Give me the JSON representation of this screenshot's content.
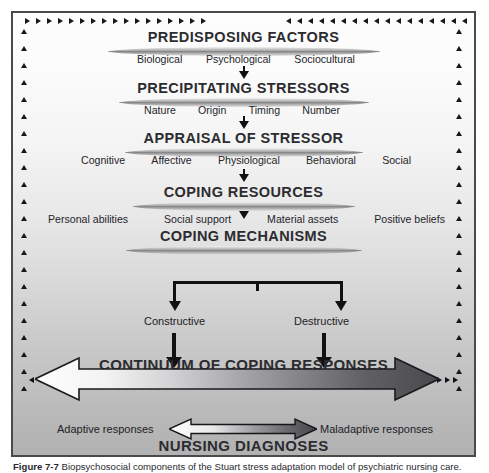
{
  "figure": {
    "headings": {
      "predisposing_factors": "PREDISPOSING FACTORS",
      "precipitating_stressors": "PRECIPITATING STRESSORS",
      "appraisal_of_stressor": "APPRAISAL OF STRESSOR",
      "coping_resources": "COPING RESOURCES",
      "coping_mechanisms": "COPING MECHANISMS",
      "continuum": "CONTINUUM OF COPING RESPONSES",
      "nursing_diagnoses": "NURSING DIAGNOSES"
    },
    "rows": {
      "predisposing_factors": [
        "Biological",
        "Psychological",
        "Sociocultural"
      ],
      "precipitating_stressors": [
        "Nature",
        "Origin",
        "Timing",
        "Number"
      ],
      "appraisal_of_stressor": [
        "Cognitive",
        "Affective",
        "Physiological",
        "Behavioral",
        "Social"
      ],
      "coping_resources": [
        "Personal abilities",
        "Social support",
        "Material assets",
        "Positive beliefs"
      ],
      "coping_mechanisms": [
        "Constructive",
        "Destructive"
      ]
    },
    "continuum_poles": {
      "adaptive": "Adaptive responses",
      "maladaptive": "Maladaptive responses"
    },
    "colors": {
      "frame_border": "#4a4a4a",
      "heading_text": "#2c2c30",
      "arrow_dark": "#4a4a4e",
      "arrow_light": "#ffffff",
      "background_top": "#fdfdfd",
      "background_bottom": "#b2b2b2"
    },
    "caption": {
      "label": "Figure 7-7",
      "text": "Biopsychosocial components of the Stuart stress adaptation model of psychiatric nursing care."
    }
  }
}
